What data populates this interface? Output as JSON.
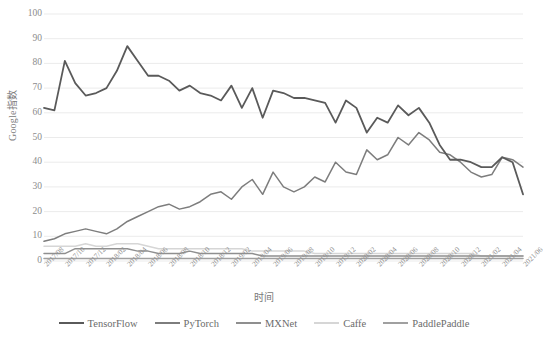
{
  "chart_data": {
    "type": "line",
    "title": "",
    "xlabel": "时间",
    "ylabel": "Google指数",
    "ylim": [
      0,
      100
    ],
    "ytick_step": 10,
    "yticks": [
      0,
      10,
      20,
      30,
      40,
      50,
      60,
      70,
      80,
      90,
      100
    ],
    "grid": true,
    "legend_position": "bottom",
    "x": [
      "2017/08",
      "2017/09",
      "2017/10",
      "2017/11",
      "2017/12",
      "2018/01",
      "2018/02",
      "2018/03",
      "2018/04",
      "2018/05",
      "2018/06",
      "2018/07",
      "2018/08",
      "2018/09",
      "2018/10",
      "2018/11",
      "2018/12",
      "2019/01",
      "2019/02",
      "2019/03",
      "2019/04",
      "2019/05",
      "2019/06",
      "2019/07",
      "2019/08",
      "2019/09",
      "2019/10",
      "2019/11",
      "2019/12",
      "2020/01",
      "2020/02",
      "2020/03",
      "2020/04",
      "2020/05",
      "2020/06",
      "2020/07",
      "2020/08",
      "2020/09",
      "2020/10",
      "2020/11",
      "2020/12",
      "2021/01",
      "2021/02",
      "2021/03",
      "2021/04",
      "2021/05",
      "2021/06"
    ],
    "xticks": [
      "2017/08",
      "2017/10",
      "2017/12",
      "2018/02",
      "2018/04",
      "2018/06",
      "2018/08",
      "2018/10",
      "2018/12",
      "2019/02",
      "2019/04",
      "2019/06",
      "2019/08",
      "2019/10",
      "2019/12",
      "2020/02",
      "2020/04",
      "2020/06",
      "2020/08",
      "2020/10",
      "2020/12",
      "2021/02",
      "2021/04",
      "2021/06"
    ],
    "series": [
      {
        "name": "TensorFlow",
        "color": "#5a5a5a",
        "values": [
          62,
          61,
          81,
          72,
          67,
          68,
          70,
          77,
          87,
          81,
          75,
          75,
          73,
          69,
          71,
          68,
          67,
          65,
          71,
          62,
          70,
          58,
          69,
          68,
          66,
          66,
          65,
          64,
          56,
          65,
          62,
          52,
          58,
          56,
          63,
          59,
          62,
          56,
          47,
          41,
          41,
          40,
          38,
          38,
          42,
          40,
          27
        ]
      },
      {
        "name": "PyTorch",
        "color": "#7d7d7d",
        "values": [
          8,
          9,
          11,
          12,
          13,
          12,
          11,
          13,
          16,
          18,
          20,
          22,
          23,
          21,
          22,
          24,
          27,
          28,
          25,
          30,
          33,
          27,
          36,
          30,
          28,
          30,
          34,
          32,
          40,
          36,
          35,
          45,
          41,
          43,
          50,
          47,
          52,
          49,
          44,
          43,
          40,
          36,
          34,
          35,
          42,
          41,
          38
        ]
      },
      {
        "name": "MXNet",
        "color": "#8f8f8f",
        "values": [
          3,
          3,
          3,
          5,
          5,
          5,
          5,
          5,
          5,
          4,
          4,
          3,
          3,
          3,
          4,
          3,
          3,
          3,
          3,
          3,
          3,
          2,
          2,
          2,
          2,
          2,
          2,
          2,
          2,
          2,
          2,
          2,
          2,
          2,
          2,
          2,
          2,
          2,
          2,
          2,
          2,
          2,
          2,
          2,
          2,
          2,
          2
        ]
      },
      {
        "name": "Caffe",
        "color": "#d6d6d6",
        "values": [
          6,
          6,
          6,
          6,
          7,
          6,
          6,
          7,
          7,
          7,
          6,
          5,
          5,
          5,
          5,
          5,
          5,
          5,
          5,
          5,
          4,
          4,
          4,
          4,
          4,
          4,
          3,
          3,
          3,
          3,
          3,
          3,
          3,
          3,
          3,
          3,
          3,
          3,
          3,
          3,
          3,
          3,
          2,
          2,
          2,
          2,
          2
        ]
      },
      {
        "name": "PaddlePaddle",
        "color": "#a0a0a0",
        "values": [
          1,
          1,
          1,
          1,
          1,
          1,
          1,
          1,
          1,
          1,
          1,
          1,
          1,
          1,
          1,
          1,
          1,
          1,
          1,
          1,
          1,
          1,
          1,
          1,
          1,
          1,
          1,
          1,
          1,
          1,
          1,
          1,
          1,
          1,
          1,
          1,
          1,
          1,
          1,
          1,
          1,
          1,
          1,
          1,
          1,
          1,
          1
        ]
      }
    ]
  },
  "legend": {
    "items": [
      {
        "label": "TensorFlow"
      },
      {
        "label": "PyTorch"
      },
      {
        "label": "MXNet"
      },
      {
        "label": "Caffe"
      },
      {
        "label": "PaddlePaddle"
      }
    ]
  }
}
